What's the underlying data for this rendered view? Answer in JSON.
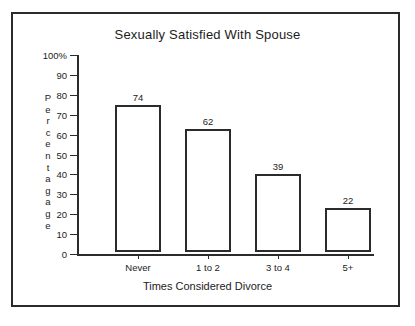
{
  "chart_data": {
    "type": "bar",
    "title": "Sexually Satisfied With Spouse",
    "xlabel": "Times Considered Divorce",
    "ylabel": "Percentagage",
    "categories": [
      "Never",
      "1 to 2",
      "3 to 4",
      "5+"
    ],
    "values": [
      74,
      62,
      39,
      22
    ],
    "value_labels": [
      "74",
      "62",
      "39",
      "22"
    ],
    "ylim": [
      0,
      100
    ],
    "ytick_labels": [
      "100%",
      "90",
      "80",
      "70",
      "60",
      "50",
      "40",
      "30",
      "20",
      "10",
      "0"
    ],
    "ytick_values": [
      100,
      90,
      80,
      70,
      60,
      50,
      40,
      30,
      20,
      10,
      0
    ],
    "grid": false,
    "legend": "none",
    "bar_fill_color": "#ffffff",
    "bar_border_color": "#2b2b2b",
    "axis_color": "#2b2b2b",
    "text_color": "#1c1c1c",
    "frame_color": "#2b2b2b",
    "background_color": "#ffffff"
  },
  "figure": {
    "title": "Sexually Satisfied With Spouse",
    "x_axis_title": "Times Considered Divorce",
    "y_axis_caption_letters": [
      "P",
      "e",
      "r",
      "c",
      "e",
      "n",
      "t",
      "a",
      "g",
      "a",
      "g",
      "e"
    ]
  },
  "caption": {
    "text": "The chart appears on a printed page below the figure"
  }
}
